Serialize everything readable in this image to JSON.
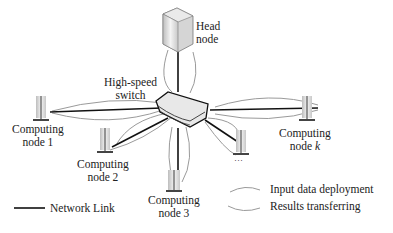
{
  "head_node": {
    "line1": "Head",
    "line2": "node"
  },
  "switch": {
    "line1": "High-speed",
    "line2": "switch"
  },
  "nodes": [
    {
      "line1": "Computing",
      "line2": "node 1"
    },
    {
      "line1": "Computing",
      "line2": "node 2"
    },
    {
      "line1": "Computing",
      "line2": "node 3"
    },
    {
      "line1": "Computing",
      "line2": "node ",
      "italic": "k"
    }
  ],
  "ellipsis": "…",
  "legend": {
    "network_link": "Network Link",
    "input": "Input data deployment",
    "results": "Results transferring"
  },
  "colors": {
    "link": "#111111",
    "flow": "#9a9a9a",
    "device": "#d9d9d9"
  }
}
